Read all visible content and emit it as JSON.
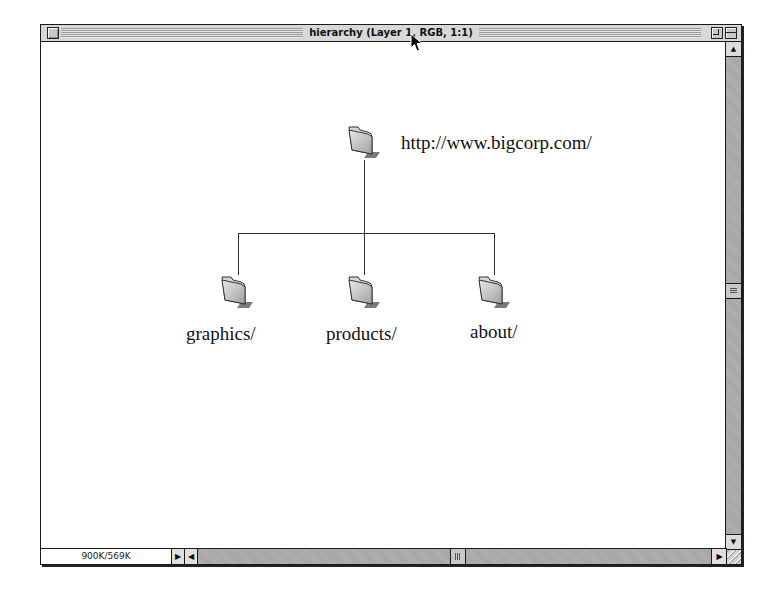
{
  "window": {
    "title": "hierarchy (Layer 1, RGB, 1:1)",
    "status_text": "900K/569K"
  },
  "icons": {
    "close_box": "close-box-icon",
    "zoom_box": "zoom-box-icon",
    "collapse_box": "collapse-box-icon",
    "folder": "folder-icon",
    "grow_box": "resize-grip-icon",
    "cursor": "arrow-cursor-icon"
  },
  "tree": {
    "root": {
      "label": "http://www.bigcorp.com/"
    },
    "children": [
      {
        "label": "graphics/"
      },
      {
        "label": "products/"
      },
      {
        "label": "about/"
      }
    ]
  },
  "scroll": {
    "up_arrow": "▲",
    "down_arrow": "▼",
    "left_arrow": "◀",
    "right_arrow": "▶",
    "status_menu_arrow": "▶"
  },
  "colors": {
    "frame": "#1a1a1a",
    "chrome": "#d4d4d4",
    "canvas": "#ffffff",
    "track": "#a8a8a8"
  }
}
